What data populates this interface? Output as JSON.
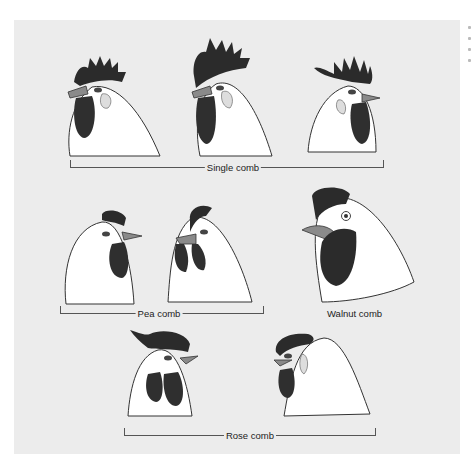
{
  "figure": {
    "groups": [
      {
        "id": "single",
        "label": "Single comb",
        "heads": 3
      },
      {
        "id": "pea",
        "label": "Pea comb",
        "heads": 2
      },
      {
        "id": "walnut",
        "label": "Walnut comb",
        "heads": 1
      },
      {
        "id": "rose",
        "label": "Rose comb",
        "heads": 2
      }
    ],
    "colors": {
      "background": "#ececec",
      "comb": "#2b2b2b",
      "wattle": "#2f2f2f",
      "feathers": "#ffffff",
      "beak": "#888888",
      "outline": "#333333"
    }
  }
}
